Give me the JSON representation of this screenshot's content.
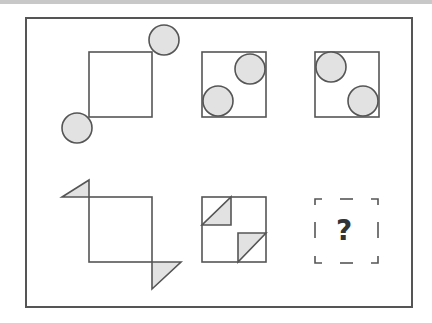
{
  "puzzle": {
    "type": "visual-analogy",
    "rows": [
      {
        "cells": [
          {
            "id": "r1c1",
            "shape": "square",
            "decorations": "circle",
            "placement": "outside-corners",
            "corners": [
              "top-right",
              "bottom-left"
            ]
          },
          {
            "id": "r1c2",
            "shape": "square",
            "decorations": "circle",
            "placement": "inside-corners",
            "corners": [
              "top-right",
              "bottom-left"
            ]
          },
          {
            "id": "r1c3",
            "shape": "square",
            "decorations": "circle",
            "placement": "inside-corners",
            "corners": [
              "top-left",
              "bottom-right"
            ]
          }
        ]
      },
      {
        "cells": [
          {
            "id": "r2c1",
            "shape": "square",
            "decorations": "triangle",
            "placement": "outside-corners",
            "corners": [
              "top-left",
              "bottom-right"
            ]
          },
          {
            "id": "r2c2",
            "shape": "square",
            "decorations": "triangle",
            "placement": "inside-corners",
            "corners": [
              "top-left",
              "bottom-right"
            ]
          },
          {
            "id": "r2c3",
            "shape": "unknown",
            "label": "?"
          }
        ]
      }
    ],
    "colors": {
      "stroke": "#555555",
      "fill": "#e2e2e2",
      "frame": "#555555",
      "question": "#333333"
    }
  }
}
